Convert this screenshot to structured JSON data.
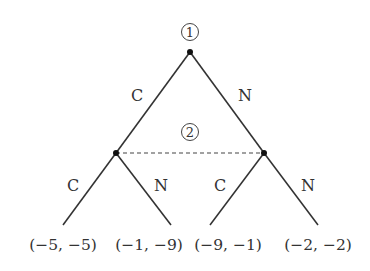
{
  "diagram": {
    "type": "extensive-form game tree",
    "players": [
      {
        "id": "1",
        "label": "1",
        "position": "root"
      },
      {
        "id": "2",
        "label": "2",
        "position": "information-set"
      }
    ],
    "edges": {
      "root_left": {
        "label": "C"
      },
      "root_right": {
        "label": "N"
      },
      "left_left": {
        "label": "C"
      },
      "left_right": {
        "label": "N"
      },
      "right_left": {
        "label": "C"
      },
      "right_right": {
        "label": "N"
      }
    },
    "payoffs": [
      {
        "text": "(−5, −5)"
      },
      {
        "text": "(−1, −9)"
      },
      {
        "text": "(−9, −1)"
      },
      {
        "text": "(−2, −2)"
      }
    ],
    "information_set": "dashed line connecting player 2 nodes",
    "colors": {
      "line": "#333333",
      "node": "#111111",
      "background": "#ffffff"
    }
  }
}
